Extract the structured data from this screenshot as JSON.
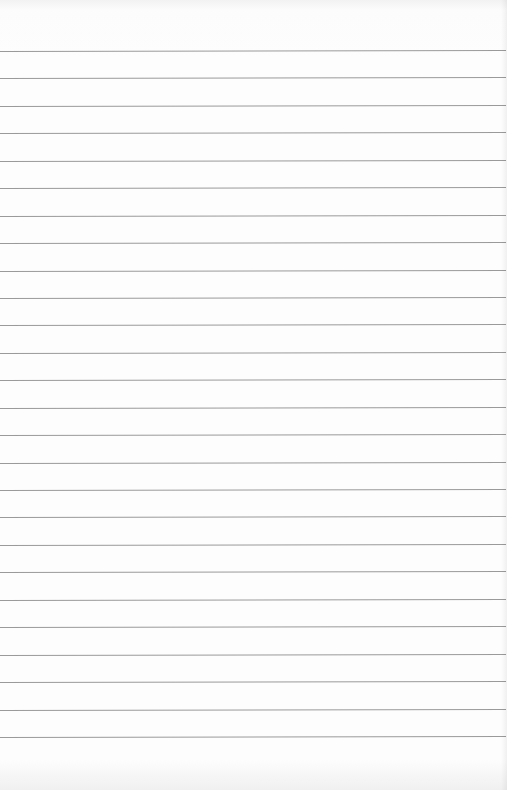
{
  "page": {
    "type": "lined-paper",
    "background_color": "#fdfdfd",
    "line_color": "#9a9a9a",
    "line_count": 26,
    "first_line_y": 51,
    "line_spacing": 27.44
  }
}
